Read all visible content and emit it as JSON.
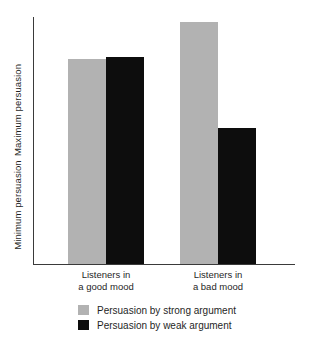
{
  "chart_data": {
    "type": "bar",
    "title": "",
    "xlabel": "",
    "ylabel": "",
    "grid": false,
    "legend_position": "bottom",
    "categories": [
      "Listeners in\na good mood",
      "Listeners in\na bad mood"
    ],
    "y_axis": {
      "top_label": "Maximum persuasion",
      "bottom_label": "Minimum persuasion",
      "ylim": [
        0,
        100
      ],
      "ticks": []
    },
    "series": [
      {
        "name": "Persuasion by strong argument",
        "color": "#b2b2b2",
        "values": [
          83,
          98
        ]
      },
      {
        "name": "Persuasion by weak argument",
        "color": "#0d0d0d",
        "values": [
          84,
          55
        ]
      }
    ]
  },
  "legend": {
    "items": [
      {
        "label": "Persuasion by strong argument",
        "color": "#b2b2b2",
        "swatch_name": "legend-swatch-strong"
      },
      {
        "label": "Persuasion by weak argument",
        "color": "#0d0d0d",
        "swatch_name": "legend-swatch-weak"
      }
    ]
  }
}
